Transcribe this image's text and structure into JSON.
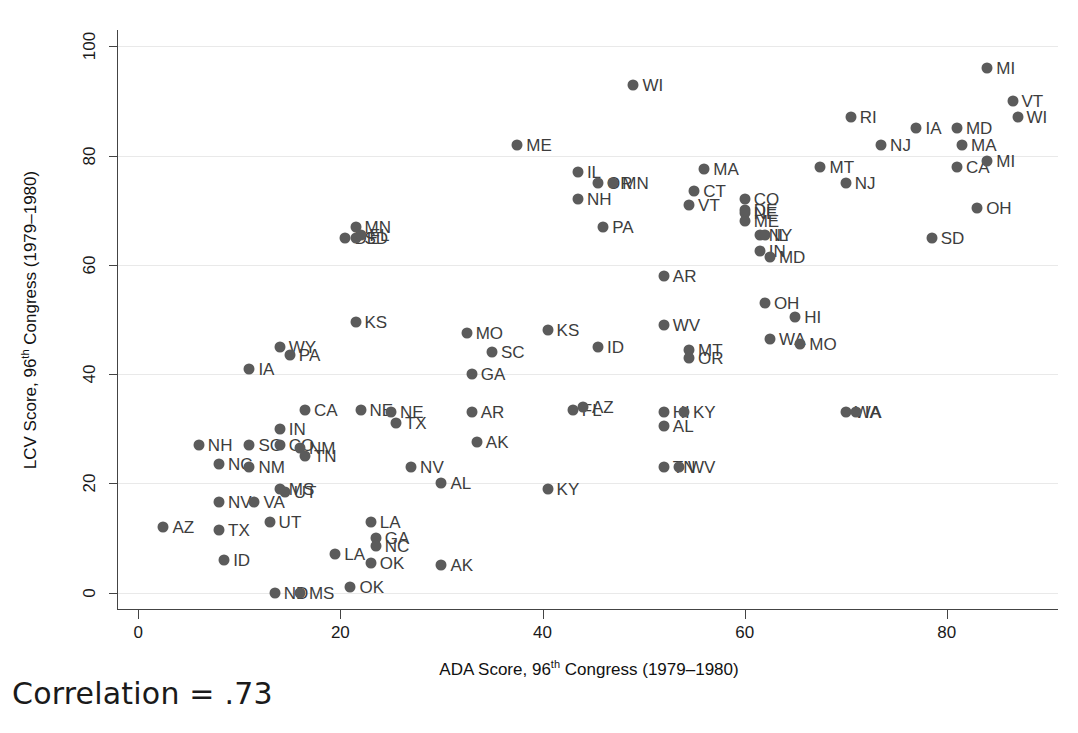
{
  "figure": {
    "caption": "Correlation = .73"
  },
  "chart_data": {
    "type": "scatter",
    "title": "",
    "subtitle": "",
    "xlabel_prefix": "ADA Score, 96",
    "xlabel_sup": "th",
    "xlabel_suffix": " Congress (1979–1980)",
    "ylabel_prefix": "LCV Score, 96",
    "ylabel_sup": "th",
    "ylabel_suffix": " Congress (1979–1980)",
    "xlabel": "ADA Score, 96th Congress (1979–1980)",
    "ylabel": "LCV Score, 96th Congress (1979–1980)",
    "xlim": [
      -2,
      91
    ],
    "ylim": [
      -3,
      103
    ],
    "xticks": [
      0,
      20,
      40,
      60,
      80
    ],
    "yticks": [
      0,
      20,
      40,
      60,
      80,
      100
    ],
    "grid": "horizontal",
    "legend": "none",
    "annotations": [
      "Correlation = .73"
    ],
    "marker_color": "#5b5b5b",
    "label_color": "#3d3d3d",
    "correlation": 0.73,
    "point_label_key": "US state abbreviation (senator observation)",
    "points": [
      {
        "label": "AZ",
        "x": 2.5,
        "y": 12
      },
      {
        "label": "NH",
        "x": 6,
        "y": 27
      },
      {
        "label": "NC",
        "x": 8,
        "y": 23.5
      },
      {
        "label": "NV",
        "x": 8,
        "y": 16.5
      },
      {
        "label": "TX",
        "x": 8,
        "y": 11.5
      },
      {
        "label": "ID",
        "x": 8.5,
        "y": 6
      },
      {
        "label": "IA",
        "x": 11,
        "y": 41
      },
      {
        "label": "SC",
        "x": 11,
        "y": 27
      },
      {
        "label": "NM",
        "x": 11,
        "y": 23
      },
      {
        "label": "VA",
        "x": 11.5,
        "y": 16.5
      },
      {
        "label": "UT",
        "x": 13,
        "y": 13
      },
      {
        "label": "ND",
        "x": 13.5,
        "y": 0
      },
      {
        "label": "WY",
        "x": 14,
        "y": 45
      },
      {
        "label": "IN",
        "x": 14,
        "y": 30
      },
      {
        "label": "CO",
        "x": 14,
        "y": 27
      },
      {
        "label": "MS",
        "x": 14,
        "y": 19
      },
      {
        "label": "UT",
        "x": 14.5,
        "y": 18.5
      },
      {
        "label": "PA",
        "x": 15,
        "y": 43.5
      },
      {
        "label": "MS",
        "x": 16,
        "y": 0
      },
      {
        "label": "NM",
        "x": 16,
        "y": 26.5
      },
      {
        "label": "CA",
        "x": 16.5,
        "y": 33.5
      },
      {
        "label": "TN",
        "x": 16.5,
        "y": 25
      },
      {
        "label": "LA",
        "x": 19.5,
        "y": 7
      },
      {
        "label": "OK",
        "x": 21,
        "y": 1
      },
      {
        "label": "KS",
        "x": 21.5,
        "y": 49.5
      },
      {
        "label": "DE",
        "x": 20.5,
        "y": 65
      },
      {
        "label": "SD",
        "x": 21.5,
        "y": 65
      },
      {
        "label": "MN",
        "x": 21.5,
        "y": 67
      },
      {
        "label": "FL",
        "x": 22,
        "y": 65.5
      },
      {
        "label": "NE",
        "x": 22,
        "y": 33.5
      },
      {
        "label": "LA",
        "x": 23,
        "y": 13
      },
      {
        "label": "GA",
        "x": 23.5,
        "y": 10
      },
      {
        "label": "NC",
        "x": 23.5,
        "y": 8.5
      },
      {
        "label": "OK",
        "x": 23,
        "y": 5.5
      },
      {
        "label": "NE",
        "x": 25,
        "y": 33
      },
      {
        "label": "TX",
        "x": 25.5,
        "y": 31
      },
      {
        "label": "AK",
        "x": 30,
        "y": 5
      },
      {
        "label": "NV",
        "x": 27,
        "y": 23
      },
      {
        "label": "AL",
        "x": 30,
        "y": 20
      },
      {
        "label": "MO",
        "x": 32.5,
        "y": 47.5
      },
      {
        "label": "AR",
        "x": 33,
        "y": 33
      },
      {
        "label": "AK",
        "x": 33.5,
        "y": 27.5
      },
      {
        "label": "GA",
        "x": 33,
        "y": 40
      },
      {
        "label": "SC",
        "x": 35,
        "y": 44
      },
      {
        "label": "ME",
        "x": 37.5,
        "y": 82
      },
      {
        "label": "KY",
        "x": 40.5,
        "y": 19
      },
      {
        "label": "KS",
        "x": 40.5,
        "y": 48
      },
      {
        "label": "FL",
        "x": 43,
        "y": 33.5
      },
      {
        "label": "IL",
        "x": 43.5,
        "y": 77
      },
      {
        "label": "NH",
        "x": 43.5,
        "y": 72
      },
      {
        "label": "AZ",
        "x": 44,
        "y": 34
      },
      {
        "label": "ID",
        "x": 45.5,
        "y": 45
      },
      {
        "label": "OR",
        "x": 45.5,
        "y": 75
      },
      {
        "label": "PA",
        "x": 46,
        "y": 67
      },
      {
        "label": "MN",
        "x": 47,
        "y": 75
      },
      {
        "label": "WI",
        "x": 49,
        "y": 93
      },
      {
        "label": "AR",
        "x": 52,
        "y": 58
      },
      {
        "label": "WV",
        "x": 52,
        "y": 49
      },
      {
        "label": "HI",
        "x": 52,
        "y": 33
      },
      {
        "label": "AL",
        "x": 52,
        "y": 30.5
      },
      {
        "label": "TN",
        "x": 52,
        "y": 23
      },
      {
        "label": "WV",
        "x": 53.5,
        "y": 23
      },
      {
        "label": "KY",
        "x": 54,
        "y": 33
      },
      {
        "label": "MT",
        "x": 54.5,
        "y": 44.5
      },
      {
        "label": "OR",
        "x": 54.5,
        "y": 43
      },
      {
        "label": "VT",
        "x": 54.5,
        "y": 71
      },
      {
        "label": "CT",
        "x": 55,
        "y": 73.5
      },
      {
        "label": "MA",
        "x": 56,
        "y": 77.5
      },
      {
        "label": "CO",
        "x": 60,
        "y": 72
      },
      {
        "label": "DE",
        "x": 60,
        "y": 70
      },
      {
        "label": "NE",
        "x": 60,
        "y": 69.5
      },
      {
        "label": "ME",
        "x": 60,
        "y": 68
      },
      {
        "label": "NY",
        "x": 61.5,
        "y": 65.5
      },
      {
        "label": "IL",
        "x": 62,
        "y": 65.5
      },
      {
        "label": "IN",
        "x": 61.5,
        "y": 62.5
      },
      {
        "label": "MD",
        "x": 62.5,
        "y": 61.5
      },
      {
        "label": "OH",
        "x": 62,
        "y": 53
      },
      {
        "label": "WA",
        "x": 62.5,
        "y": 46.5
      },
      {
        "label": "HI",
        "x": 65,
        "y": 50.5
      },
      {
        "label": "MO",
        "x": 65.5,
        "y": 45.5
      },
      {
        "label": "MT",
        "x": 67.5,
        "y": 78
      },
      {
        "label": "NJ",
        "x": 70,
        "y": 75
      },
      {
        "label": "RI",
        "x": 70.5,
        "y": 87
      },
      {
        "label": "WA",
        "x": 70,
        "y": 33
      },
      {
        "label": "IA",
        "x": 71,
        "y": 33
      },
      {
        "label": "NJ",
        "x": 73.5,
        "y": 82
      },
      {
        "label": "IA",
        "x": 77,
        "y": 85
      },
      {
        "label": "SD",
        "x": 78.5,
        "y": 65
      },
      {
        "label": "MD",
        "x": 81,
        "y": 85
      },
      {
        "label": "MA",
        "x": 81.5,
        "y": 82
      },
      {
        "label": "CA",
        "x": 81,
        "y": 78
      },
      {
        "label": "OH",
        "x": 83,
        "y": 70.5
      },
      {
        "label": "MI",
        "x": 84,
        "y": 96
      },
      {
        "label": "MI",
        "x": 84,
        "y": 79
      },
      {
        "label": "VT",
        "x": 86.5,
        "y": 90
      },
      {
        "label": "WI",
        "x": 87,
        "y": 87
      }
    ]
  }
}
